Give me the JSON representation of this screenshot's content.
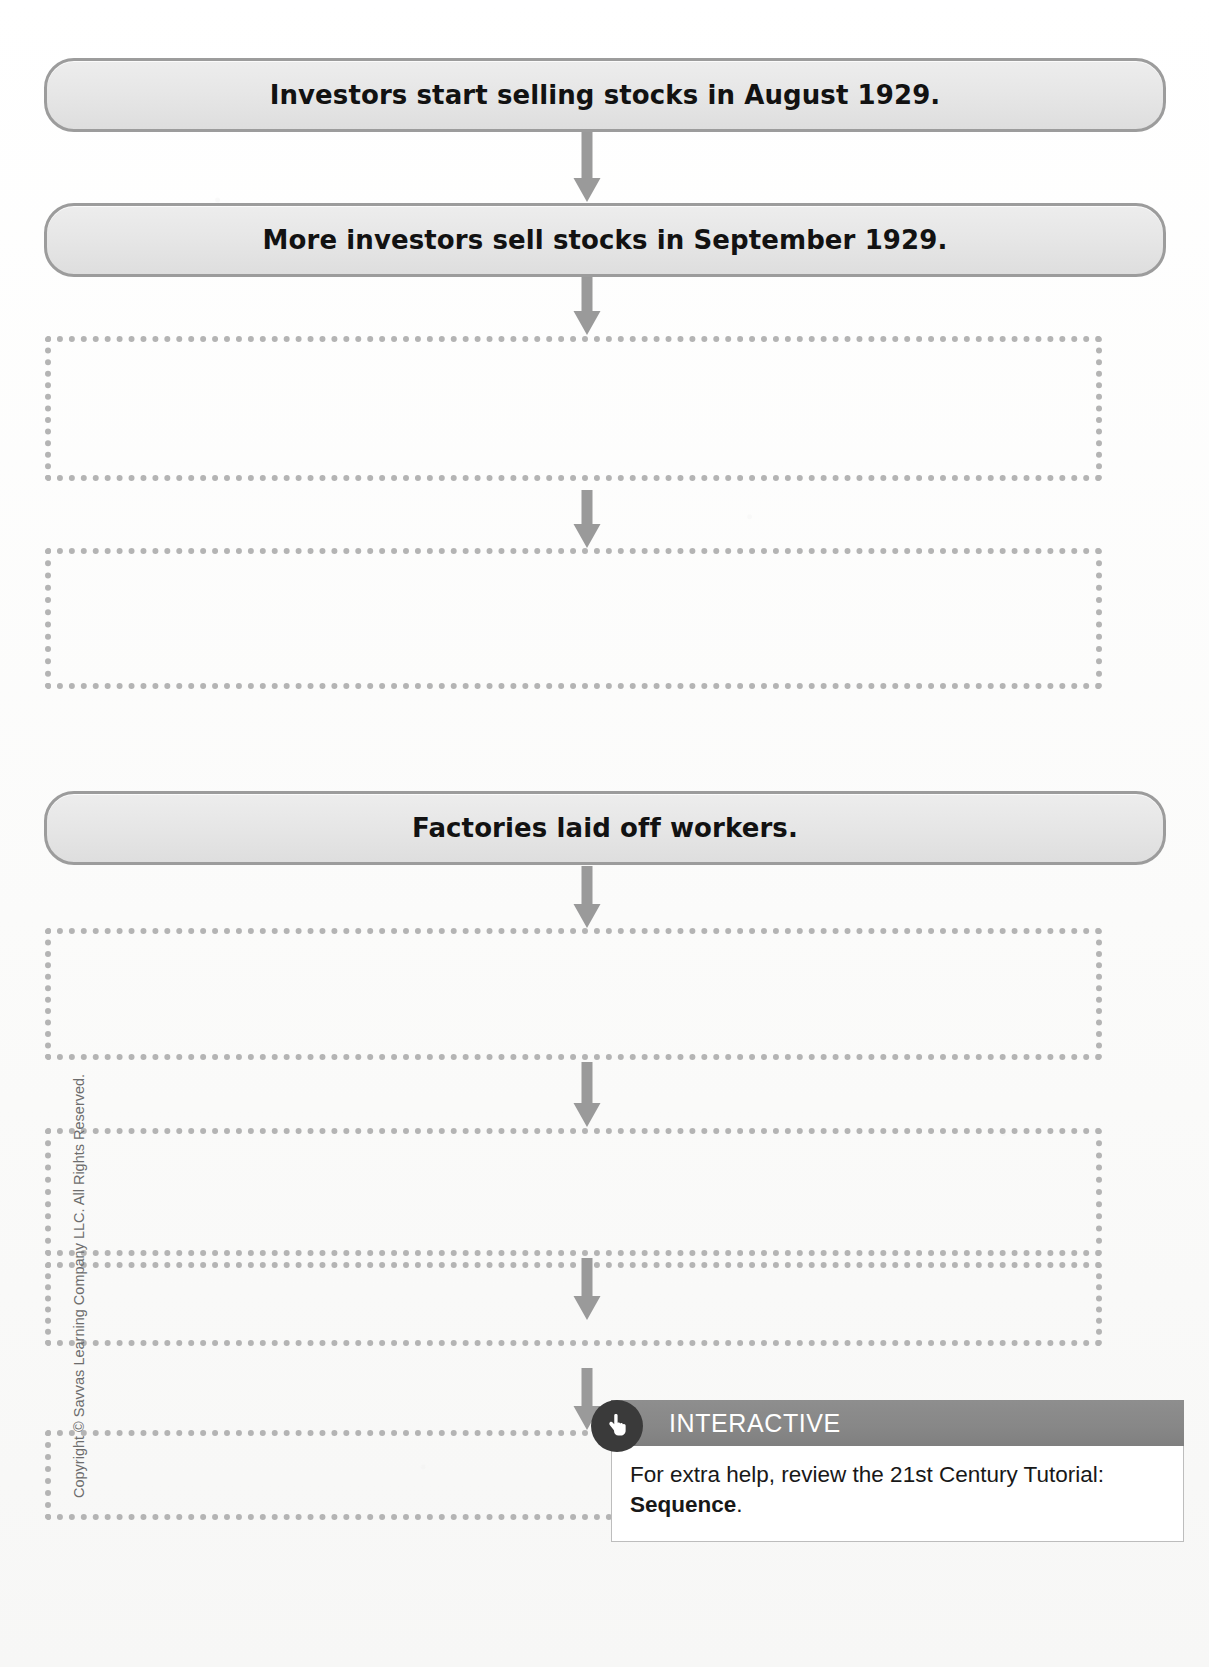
{
  "page": {
    "copyright": "Copyright © Savvas Learning Company LLC. All Rights Reserved.",
    "colors": {
      "box_fill": "#e8e8e8",
      "box_border": "#9c9c9c",
      "dotted_border": "#b4b4b4",
      "arrow": "#9a9a9a",
      "banner_bg": "#878787",
      "badge_bg": "#3a3a3a",
      "banner_text": "#ffffff"
    }
  },
  "flowchart": {
    "type": "sequence-flowchart",
    "steps": [
      {
        "index": 1,
        "kind": "filled",
        "label": "Investors start selling stocks in August 1929.",
        "x": 44,
        "y": 58,
        "width": 1122,
        "height": 74
      },
      {
        "index": 2,
        "kind": "filled",
        "label": "More investors sell stocks in September 1929.",
        "x": 44,
        "y": 203,
        "width": 1122,
        "height": 74
      },
      {
        "index": 3,
        "kind": "blank",
        "label": "",
        "x": 45,
        "y": 336,
        "width": 1057,
        "height": 145
      },
      {
        "index": 4,
        "kind": "blank",
        "label": "",
        "x": 45,
        "y": 548,
        "width": 1057,
        "height": 141
      },
      {
        "index": 5,
        "kind": "filled",
        "label": "Factories laid off workers.",
        "x": 44,
        "y": 791,
        "width": 1122,
        "height": 74
      },
      {
        "index": 6,
        "kind": "blank",
        "label": "",
        "x": 45,
        "y": 928,
        "width": 1057,
        "height": 132
      },
      {
        "index": 7,
        "kind": "blank",
        "label": "",
        "x": 45,
        "y": 1128,
        "width": 1057,
        "height": 128
      },
      {
        "index": 8,
        "kind": "blank",
        "label": "",
        "x": 45,
        "y": 1262,
        "width": 1057,
        "height": 84
      },
      {
        "index": 9,
        "kind": "blank",
        "label": "",
        "x": 45,
        "y": 1430,
        "width": 1057,
        "height": 90
      }
    ],
    "arrows": [
      {
        "index": 1,
        "from_step": 1,
        "to_step": 2,
        "x": 570,
        "y": 132,
        "height": 70
      },
      {
        "index": 2,
        "from_step": 2,
        "to_step": 3,
        "x": 570,
        "y": 277,
        "height": 58
      },
      {
        "index": 3,
        "from_step": 3,
        "to_step": 4,
        "x": 570,
        "y": 490,
        "height": 58
      },
      {
        "index": 4,
        "from_step": 5,
        "to_step": 6,
        "x": 570,
        "y": 866,
        "height": 62
      },
      {
        "index": 5,
        "from_step": 6,
        "to_step": 7,
        "x": 570,
        "y": 1062,
        "height": 65
      },
      {
        "index": 6,
        "from_step": 7,
        "to_step": 8,
        "x": 570,
        "y": 1258,
        "height": 62
      },
      {
        "index": 7,
        "from_step": 8,
        "to_step": 9,
        "x": 570,
        "y": 1368,
        "height": 62
      }
    ]
  },
  "interactive": {
    "icon": "hand-pointer-icon",
    "banner_label": "INTERACTIVE",
    "body_prefix": "For extra help, review the 21st Century Tutorial: ",
    "body_emphasis": "Sequence",
    "body_suffix": "."
  }
}
